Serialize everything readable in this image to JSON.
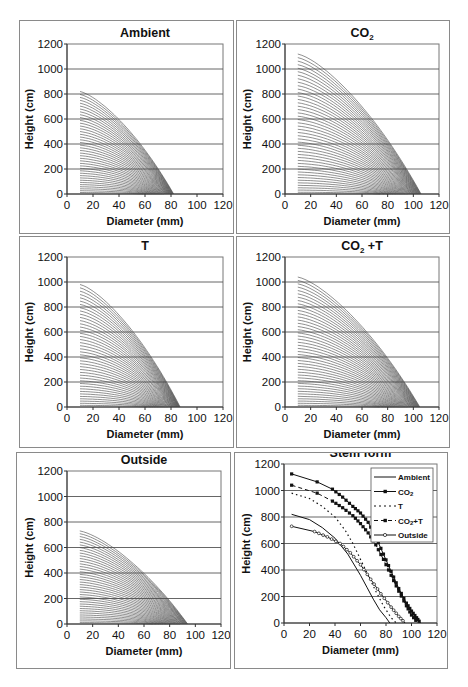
{
  "figure": {
    "panels": [
      {
        "id": "ambient",
        "title": "Ambient",
        "sub": "",
        "title_suffix": ""
      },
      {
        "id": "co2",
        "title": "CO",
        "sub": "2",
        "title_suffix": ""
      },
      {
        "id": "t",
        "title": "T",
        "sub": "",
        "title_suffix": ""
      },
      {
        "id": "co2t",
        "title": "CO",
        "sub": "2",
        "title_suffix": " +T"
      },
      {
        "id": "outside",
        "title": "Outside",
        "sub": "",
        "title_suffix": ""
      },
      {
        "id": "stemform",
        "title": "Stem form",
        "sub": "",
        "title_suffix": ""
      }
    ],
    "xlabel": "Diameter (mm)",
    "ylabel": "Height (cm)",
    "xticks": [
      "0",
      "20",
      "40",
      "60",
      "80",
      "100",
      "120"
    ],
    "yticks": [
      "0",
      "200",
      "400",
      "600",
      "800",
      "1000",
      "1200"
    ]
  },
  "chart_data": [
    {
      "type": "line",
      "title": "Ambient",
      "xlabel": "Diameter (mm)",
      "ylabel": "Height (cm)",
      "xlim": [
        0,
        120
      ],
      "ylim": [
        0,
        1200
      ],
      "grid": "horizontal",
      "description": "Family of ~40 stem profile curves starting at diameter 10 mm; tallest curve starts at height ~820 cm, all converge to 0 at ~82 mm",
      "series_count": 40,
      "start_x": 10,
      "max_height": 820,
      "end_x": 82
    },
    {
      "type": "line",
      "title": "CO2",
      "xlabel": "Diameter (mm)",
      "ylabel": "Height (cm)",
      "xlim": [
        0,
        120
      ],
      "ylim": [
        0,
        1200
      ],
      "grid": "horizontal",
      "description": "Family of ~45 stem profile curves starting at diameter 10 mm; tallest curve starts at height ~1120 cm, converging to 0 at ~106 mm",
      "series_count": 45,
      "start_x": 10,
      "max_height": 1120,
      "end_x": 106
    },
    {
      "type": "line",
      "title": "T",
      "xlabel": "Diameter (mm)",
      "ylabel": "Height (cm)",
      "xlim": [
        0,
        120
      ],
      "ylim": [
        0,
        1200
      ],
      "grid": "horizontal",
      "description": "Family of ~42 stem profile curves starting at diameter 10 mm; tallest curve starts at height ~980 cm, converging to 0 at ~87 mm",
      "series_count": 42,
      "start_x": 10,
      "max_height": 980,
      "end_x": 87
    },
    {
      "type": "line",
      "title": "CO2 +T",
      "xlabel": "Diameter (mm)",
      "ylabel": "Height (cm)",
      "xlim": [
        0,
        120
      ],
      "ylim": [
        0,
        1200
      ],
      "grid": "horizontal",
      "description": "Family of ~44 stem profile curves starting at diameter 10 mm; tallest curve starts at height ~1040 cm, converging to 0 at ~105 mm",
      "series_count": 44,
      "start_x": 10,
      "max_height": 1040,
      "end_x": 105
    },
    {
      "type": "line",
      "title": "Outside",
      "xlabel": "Diameter (mm)",
      "ylabel": "Height (cm)",
      "xlim": [
        0,
        120
      ],
      "ylim": [
        0,
        1200
      ],
      "grid": "horizontal",
      "description": "Family of ~38 stem profile curves starting at diameter 10 mm; tallest curve starts at height ~730 cm, converging to 0 at ~94 mm",
      "series_count": 38,
      "start_x": 10,
      "max_height": 730,
      "end_x": 94
    },
    {
      "type": "line",
      "title": "Stem form",
      "xlabel": "Diameter (mm)",
      "ylabel": "Height (cm)",
      "xlim": [
        0,
        120
      ],
      "ylim": [
        0,
        1200
      ],
      "grid": "horizontal",
      "legend": {
        "position": "upper right",
        "entries": [
          "Ambient",
          "CO2",
          "T",
          "CO2+T",
          "Outside"
        ]
      },
      "series": [
        {
          "name": "Ambient",
          "style": "solid",
          "marker": "none",
          "x": [
            6,
            20,
            30,
            40,
            50,
            60,
            65,
            70,
            75,
            80,
            83
          ],
          "y": [
            820,
            780,
            720,
            640,
            520,
            360,
            270,
            180,
            100,
            40,
            0
          ]
        },
        {
          "name": "CO2",
          "style": "solid",
          "marker": "square-filled",
          "x": [
            6,
            26,
            38,
            46,
            54,
            60,
            66,
            72,
            78,
            84,
            90,
            96,
            100,
            104,
            107
          ],
          "y": [
            1125,
            1065,
            1010,
            950,
            880,
            830,
            760,
            650,
            520,
            390,
            260,
            150,
            90,
            40,
            0
          ]
        },
        {
          "name": "T",
          "style": "dotted",
          "marker": "none",
          "x": [
            6,
            20,
            30,
            40,
            48,
            54,
            60,
            66,
            72,
            78,
            84,
            88
          ],
          "y": [
            980,
            940,
            880,
            800,
            700,
            600,
            480,
            360,
            240,
            130,
            40,
            0
          ]
        },
        {
          "name": "CO2+T",
          "style": "dashed",
          "marker": "square-filled",
          "x": [
            6,
            26,
            38,
            46,
            54,
            60,
            66,
            72,
            78,
            84,
            90,
            96,
            100,
            105
          ],
          "y": [
            1040,
            980,
            920,
            870,
            810,
            750,
            680,
            590,
            480,
            360,
            240,
            130,
            60,
            0
          ]
        },
        {
          "name": "Outside",
          "style": "solid",
          "marker": "circle-open",
          "x": [
            6,
            24,
            34,
            44,
            52,
            60,
            68,
            76,
            84,
            90,
            95
          ],
          "y": [
            730,
            690,
            650,
            600,
            530,
            440,
            330,
            220,
            120,
            50,
            0
          ]
        }
      ]
    }
  ]
}
